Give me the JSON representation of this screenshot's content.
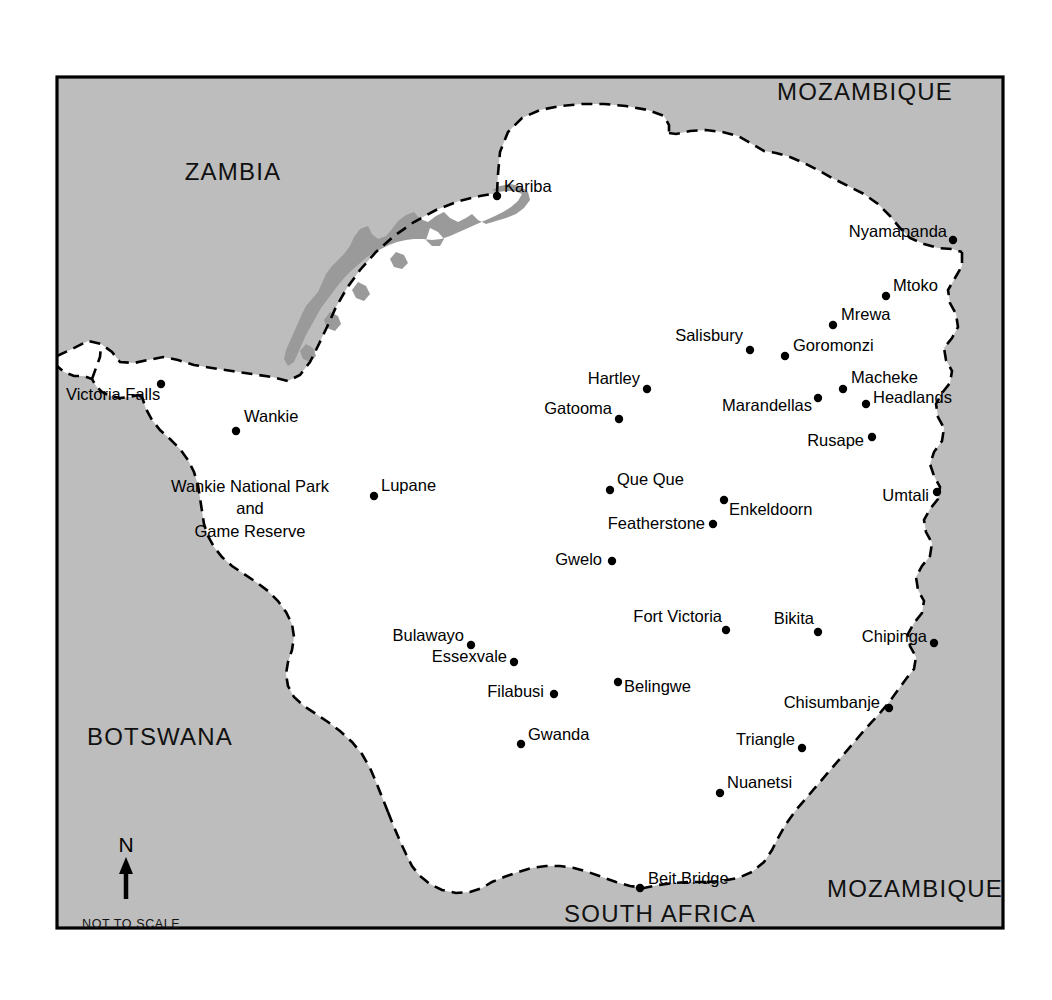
{
  "map": {
    "frame": {
      "x": 57,
      "y": 77,
      "width": 946,
      "height": 851
    },
    "colors": {
      "neighbor_fill": "#bdbdbd",
      "country_fill": "#ffffff",
      "lake_fill": "#9a9a9a",
      "border_line": "#000000",
      "frame_line": "#000000",
      "page_background": "#ffffff"
    },
    "scale_note": "NOT TO SCALE",
    "compass": {
      "label": "N",
      "direction": "north"
    },
    "country_labels": [
      {
        "name": "ZAMBIA",
        "x": 233,
        "y": 180
      },
      {
        "name": "MOZAMBIQUE",
        "x": 865,
        "y": 100
      },
      {
        "name": "BOTSWANA",
        "x": 160,
        "y": 745
      },
      {
        "name": "MOZAMBIQUE",
        "x": 915,
        "y": 897
      },
      {
        "name": "SOUTH AFRICA",
        "x": 660,
        "y": 922
      }
    ],
    "area_labels": [
      {
        "name": "Wankie National Park",
        "x": 250,
        "y": 492
      },
      {
        "name": "and",
        "x": 250,
        "y": 514
      },
      {
        "name": "Game Reserve",
        "x": 250,
        "y": 537
      }
    ],
    "cities": [
      {
        "name": "Kariba",
        "dot_x": 497,
        "dot_y": 196,
        "label_x": 504,
        "label_y": 192,
        "anchor": "start"
      },
      {
        "name": "Nyamapanda",
        "dot_x": 953,
        "dot_y": 240,
        "label_x": 947,
        "label_y": 237,
        "anchor": "end"
      },
      {
        "name": "Mtoko",
        "dot_x": 886,
        "dot_y": 296,
        "label_x": 893,
        "label_y": 291,
        "anchor": "start"
      },
      {
        "name": "Mrewa",
        "dot_x": 833,
        "dot_y": 325,
        "label_x": 841,
        "label_y": 320,
        "anchor": "start"
      },
      {
        "name": "Salisbury",
        "dot_x": 750,
        "dot_y": 350,
        "label_x": 743,
        "label_y": 341,
        "anchor": "end"
      },
      {
        "name": "Goromonzi",
        "dot_x": 785,
        "dot_y": 356,
        "label_x": 793,
        "label_y": 351,
        "anchor": "start"
      },
      {
        "name": "Macheke",
        "dot_x": 843,
        "dot_y": 389,
        "label_x": 851,
        "label_y": 383,
        "anchor": "start"
      },
      {
        "name": "Headlands",
        "dot_x": 866,
        "dot_y": 404,
        "label_x": 873,
        "label_y": 403,
        "anchor": "start"
      },
      {
        "name": "Hartley",
        "dot_x": 647,
        "dot_y": 389,
        "label_x": 640,
        "label_y": 384,
        "anchor": "end"
      },
      {
        "name": "Gatooma",
        "dot_x": 619,
        "dot_y": 419,
        "label_x": 612,
        "label_y": 414,
        "anchor": "end"
      },
      {
        "name": "Marandellas",
        "dot_x": 556,
        "dot_y": 682,
        "label_x": 556,
        "label_y": 682,
        "anchor": "start"
      },
      {
        "name": "Rusape",
        "dot_x": 872,
        "dot_y": 437,
        "label_x": 864,
        "label_y": 446,
        "anchor": "end"
      },
      {
        "name": "Victoria Falls",
        "dot_x": 161,
        "dot_y": 384,
        "label_x": 153,
        "label_y": 400,
        "anchor": "end"
      },
      {
        "name": "Wankie",
        "dot_x": 236,
        "dot_y": 431,
        "label_x": 244,
        "label_y": 422,
        "anchor": "start"
      },
      {
        "name": "Lupane",
        "dot_x": 374,
        "dot_y": 496,
        "label_x": 381,
        "label_y": 491,
        "anchor": "start"
      },
      {
        "name": "Que Que",
        "dot_x": 610,
        "dot_y": 490,
        "label_x": 617,
        "label_y": 485,
        "anchor": "start"
      },
      {
        "name": "Enkeldoorn",
        "dot_x": 724,
        "dot_y": 500,
        "label_x": 731,
        "label_y": 515,
        "anchor": "start"
      },
      {
        "name": "Featherstone",
        "dot_x": 713,
        "dot_y": 524,
        "label_x": 705,
        "label_y": 529,
        "anchor": "end"
      },
      {
        "name": "Umtali",
        "dot_x": 937,
        "dot_y": 492,
        "label_x": 929,
        "label_y": 501,
        "anchor": "end"
      },
      {
        "name": "Gwelo",
        "dot_x": 612,
        "dot_y": 561,
        "label_x": 604,
        "label_y": 565,
        "anchor": "end"
      },
      {
        "name": "Fort Victoria",
        "dot_x": 726,
        "dot_y": 630,
        "label_x": 718,
        "label_y": 622,
        "anchor": "end"
      },
      {
        "name": "Bikita",
        "dot_x": 818,
        "dot_y": 632,
        "label_x": 810,
        "label_y": 624,
        "anchor": "end"
      },
      {
        "name": "Chipinga",
        "dot_x": 934,
        "dot_y": 643,
        "label_x": 927,
        "label_y": 642,
        "anchor": "end"
      },
      {
        "name": "Bulawayo",
        "dot_x": 471,
        "dot_y": 645,
        "label_x": 464,
        "label_y": 641,
        "anchor": "end"
      },
      {
        "name": "Essexvale",
        "dot_x": 514,
        "dot_y": 662,
        "label_x": 507,
        "label_y": 662,
        "anchor": "end"
      },
      {
        "name": "Filabusi",
        "dot_x": 554,
        "dot_y": 694,
        "label_x": 544,
        "label_y": 697,
        "anchor": "end"
      },
      {
        "name": "Belingwe",
        "dot_x": 618,
        "dot_y": 682,
        "label_x": 625,
        "label_y": 692,
        "anchor": "start"
      },
      {
        "name": "Chisumbanje",
        "dot_x": 889,
        "dot_y": 708,
        "label_x": 880,
        "label_y": 708,
        "anchor": "end"
      },
      {
        "name": "Gwanda",
        "dot_x": 521,
        "dot_y": 744,
        "label_x": 528,
        "label_y": 740,
        "anchor": "start"
      },
      {
        "name": "Triangle",
        "dot_x": 802,
        "dot_y": 748,
        "label_x": 795,
        "label_y": 745,
        "anchor": "end"
      },
      {
        "name": "Nuanetsi",
        "dot_x": 720,
        "dot_y": 793,
        "label_x": 727,
        "label_y": 788,
        "anchor": "start"
      },
      {
        "name": "Beit Bridge",
        "dot_x": 640,
        "dot_y": 888,
        "label_x": 648,
        "label_y": 884,
        "anchor": "start"
      }
    ],
    "features": [
      {
        "name": "Lake Kariba",
        "type": "lake"
      }
    ]
  }
}
